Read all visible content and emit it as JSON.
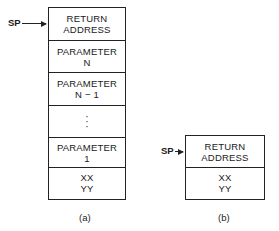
{
  "diagram_a": {
    "pointer_label": "SP",
    "cells": [
      {
        "line1": "RETURN",
        "line2": "ADDRESS"
      },
      {
        "line1": "PARAMETER",
        "line2": "N"
      },
      {
        "line1": "PARAMETER",
        "line2": "N − 1"
      },
      {
        "line1": ":",
        "line2": ""
      },
      {
        "line1": "PARAMETER",
        "line2": "1"
      },
      {
        "line1": "XX",
        "line2": "YY"
      }
    ],
    "caption": "(a)"
  },
  "diagram_b": {
    "pointer_label": "SP",
    "cells": [
      {
        "line1": "RETURN",
        "line2": "ADDRESS"
      },
      {
        "line1": "XX",
        "line2": "YY"
      }
    ],
    "caption": "(b)"
  }
}
